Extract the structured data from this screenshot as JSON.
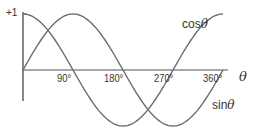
{
  "chart_data": {
    "type": "line",
    "title": "",
    "xlabel": "θ",
    "ylabel": "",
    "x_ticks": [
      "90°",
      "180°",
      "270°",
      "360°"
    ],
    "x_tick_values": [
      90,
      180,
      270,
      360
    ],
    "y_ticks": [
      "+1"
    ],
    "y_tick_values": [
      1
    ],
    "xlim": [
      0,
      370
    ],
    "ylim": [
      -1,
      1
    ],
    "grid": false,
    "legend": "inline labels",
    "series": [
      {
        "name": "cosθ",
        "label": "cos",
        "var": "θ",
        "function": "cos",
        "x": [
          0,
          45,
          90,
          135,
          180,
          225,
          270,
          315,
          360
        ],
        "values": [
          1,
          0.707,
          0,
          -0.707,
          -1,
          -0.707,
          0,
          0.707,
          1
        ]
      },
      {
        "name": "sinθ",
        "label": "sin",
        "var": "θ",
        "function": "sin",
        "x": [
          0,
          45,
          90,
          135,
          180,
          225,
          270,
          315,
          360
        ],
        "values": [
          0,
          0.707,
          1,
          0.707,
          0,
          -0.707,
          -1,
          -0.707,
          0
        ]
      }
    ]
  },
  "style": {
    "curve_color": "#6e6e6e",
    "axis_color": "#555555",
    "text_color": "#333333"
  },
  "layout": {
    "origin_x": 23,
    "origin_y": 70,
    "px_per_degree": 0.5556,
    "px_per_unit": 56,
    "axis_x_end": 228,
    "axis_y_top": 12,
    "axis_y_bottom": 101
  }
}
